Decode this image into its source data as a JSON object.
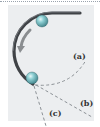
{
  "figure": {
    "panel_color": "#eceef0",
    "track_color": "#3f4246",
    "ball_color": "#7fc3c8",
    "arrow_color": "#8a8d90",
    "path_color": "#8c9196",
    "labels": {
      "a": "(a)",
      "b": "(b)",
      "c": "(c)"
    }
  }
}
